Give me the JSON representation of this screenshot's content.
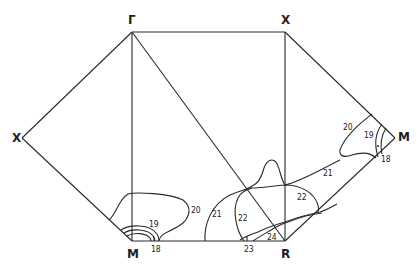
{
  "diagram": {
    "type": "brillouin-zone-contour-map",
    "vertices": [
      {
        "id": "gamma",
        "label": "Γ",
        "x": 132,
        "y": 32
      },
      {
        "id": "x_top",
        "label": "X",
        "x": 285,
        "y": 32
      },
      {
        "id": "x_left",
        "label": "X",
        "x": 22,
        "y": 138
      },
      {
        "id": "m_bottom",
        "label": "M",
        "x": 132,
        "y": 241
      },
      {
        "id": "r_bottom",
        "label": "R",
        "x": 285,
        "y": 241
      },
      {
        "id": "m_right",
        "label": "M",
        "x": 395,
        "y": 138
      }
    ],
    "contour_labels": [
      {
        "value": "20",
        "x": 191,
        "y": 213
      },
      {
        "value": "19",
        "x": 149,
        "y": 227
      },
      {
        "value": "18",
        "x": 151,
        "y": 252
      },
      {
        "value": "21",
        "x": 212,
        "y": 217
      },
      {
        "value": "22",
        "x": 238,
        "y": 221
      },
      {
        "value": "22",
        "x": 297,
        "y": 200
      },
      {
        "value": "21",
        "x": 323,
        "y": 176
      },
      {
        "value": "23",
        "x": 244,
        "y": 252
      },
      {
        "value": "24",
        "x": 267,
        "y": 240
      },
      {
        "value": "20",
        "x": 343,
        "y": 130
      },
      {
        "value": "19",
        "x": 364,
        "y": 138
      },
      {
        "value": "18",
        "x": 381,
        "y": 162
      }
    ]
  }
}
